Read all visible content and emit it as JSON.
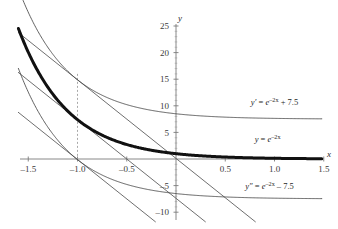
{
  "chart_data": {
    "type": "line",
    "title": "",
    "subtitle": "",
    "xlabel": "x",
    "ylabel": "y",
    "xlim": [
      -1.6,
      1.6
    ],
    "ylim": [
      -11,
      26
    ],
    "grid": false,
    "legend_position": "inline-right",
    "x_ticks": [
      {
        "value": -1.5,
        "label": "–1.5"
      },
      {
        "value": -1.0,
        "label": "–1.0"
      },
      {
        "value": -0.5,
        "label": "–0.5"
      },
      {
        "value": 0.5,
        "label": "0.5"
      },
      {
        "value": 1.0,
        "label": "1.0"
      },
      {
        "value": 1.5,
        "label": "1.5"
      }
    ],
    "y_ticks": [
      {
        "value": 25,
        "label": "25"
      },
      {
        "value": 20,
        "label": "20"
      },
      {
        "value": 15,
        "label": "15"
      },
      {
        "value": 10,
        "label": "10"
      },
      {
        "value": 5,
        "label": "5"
      },
      {
        "value": -5,
        "label": "–5"
      },
      {
        "value": -10,
        "label": "–10"
      }
    ],
    "series": [
      {
        "name": "y-prime-curve",
        "expression": "y' = e^(-2x) + 7.5",
        "offset": 7.5,
        "style": "thin",
        "label_parts": {
          "lhs": "y′",
          "eq": " = ",
          "base": "e",
          "exponent": "–2x",
          "tail": " + 7.5"
        },
        "label_x": 1.0,
        "label_y": 10.2
      },
      {
        "name": "y-curve",
        "expression": "y = e^(-2x)",
        "offset": 0,
        "style": "thick",
        "label_parts": {
          "lhs": "y",
          "eq": " = ",
          "base": "e",
          "exponent": "–2x",
          "tail": ""
        },
        "label_x": 0.93,
        "label_y": 3.2
      },
      {
        "name": "y-double-prime-curve",
        "expression": "y'' = e^(-2x) - 7.5",
        "offset": -7.5,
        "style": "thin",
        "label_parts": {
          "lhs": "y″",
          "eq": " = ",
          "base": "e",
          "exponent": "–2x",
          "tail": " – 7.5"
        },
        "label_x": 0.95,
        "label_y": -5.6
      }
    ],
    "tangent_lines": [
      {
        "name": "tangent-at-minus-one-upper",
        "point_x": -1.0,
        "offset": 7.5,
        "slope": -14.778,
        "value_at_point": 14.889
      },
      {
        "name": "tangent-at-minus-one-middle",
        "point_x": -1.0,
        "offset": 0,
        "slope": -14.778,
        "value_at_point": 7.389
      },
      {
        "name": "tangent-at-minus-one-lower",
        "point_x": -1.0,
        "offset": -7.5,
        "slope": -14.778,
        "value_at_point": -0.111
      }
    ],
    "markers": [
      {
        "name": "dashed-vertical-line",
        "x": -1.0,
        "y_from": -0.5,
        "y_to": 16.0,
        "style": "dashed"
      }
    ],
    "annotations": [
      {
        "name": "x-axis-name",
        "text": "x"
      },
      {
        "name": "y-axis-name",
        "text": "y"
      }
    ],
    "colors": {
      "curve_thick": "#111111",
      "curve_thin": "#444444",
      "tangent": "#555555",
      "axis": "#777777",
      "dashed": "#999999",
      "text": "#242424",
      "background": "#ffffff"
    }
  }
}
